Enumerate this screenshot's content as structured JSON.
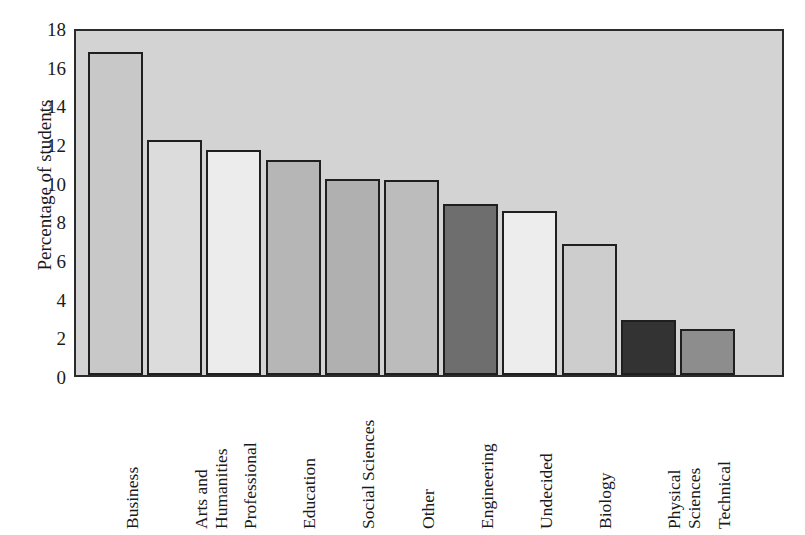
{
  "chart_data": {
    "type": "bar",
    "title": "",
    "xlabel": "",
    "ylabel": "Percentage of students",
    "ylim": [
      0,
      18
    ],
    "y_ticks": [
      0,
      2,
      4,
      6,
      8,
      10,
      12,
      14,
      16,
      18
    ],
    "y_tick_labels": [
      "0",
      "2",
      "4",
      "6",
      "8",
      "10",
      "12",
      "14",
      "16",
      "18"
    ],
    "grid": false,
    "legend": false,
    "plot_background": "#d3d3d3",
    "axis_color": "#2b2b2b",
    "bar_edge_color": "#1f1f1f",
    "categories": [
      "Business",
      "Arts and Humanities",
      "Professional",
      "Education",
      "Social Sciences",
      "Other",
      "Engineering",
      "Undecided",
      "Biology",
      "Physical Sciences",
      "Technical"
    ],
    "category_label_lines": [
      [
        "Business"
      ],
      [
        "Arts and",
        "Humanities"
      ],
      [
        "Professional"
      ],
      [
        "Education"
      ],
      [
        "Social Sciences"
      ],
      [
        "Other"
      ],
      [
        "Engineering"
      ],
      [
        "Undecided"
      ],
      [
        "Biology"
      ],
      [
        "Physical",
        "Sciences"
      ],
      [
        "Technical"
      ]
    ],
    "values": [
      16.7,
      12.15,
      11.65,
      11.1,
      10.15,
      10.1,
      8.85,
      8.5,
      6.8,
      2.85,
      2.4
    ],
    "bar_colors": [
      "#c8c8c8",
      "#dcdcdc",
      "#ececec",
      "#b6b6b6",
      "#b0b0b0",
      "#bcbcbc",
      "#6e6e6e",
      "#ededed",
      "#cdcdcd",
      "#333333",
      "#8d8d8d"
    ]
  }
}
